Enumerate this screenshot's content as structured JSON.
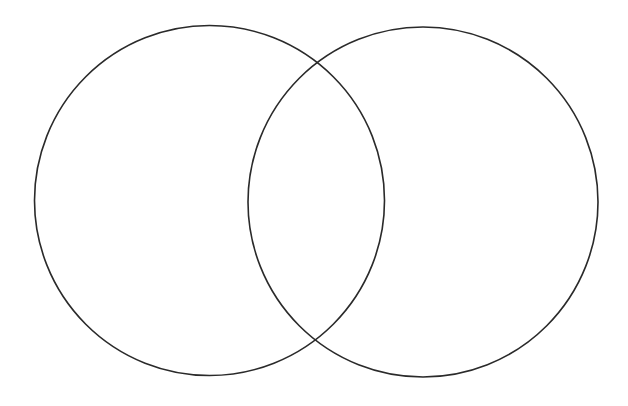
{
  "diagram": {
    "type": "venn",
    "canvas": {
      "width": 628,
      "height": 406,
      "background": "#ffffff"
    },
    "stroke_color": "#2a2a2a",
    "circles": [
      {
        "id": "left",
        "cx": 209.5,
        "cy": 200.5,
        "r": 175,
        "label": ""
      },
      {
        "id": "right",
        "cx": 423,
        "cy": 202,
        "r": 175,
        "label": ""
      }
    ],
    "intersection_label": ""
  }
}
